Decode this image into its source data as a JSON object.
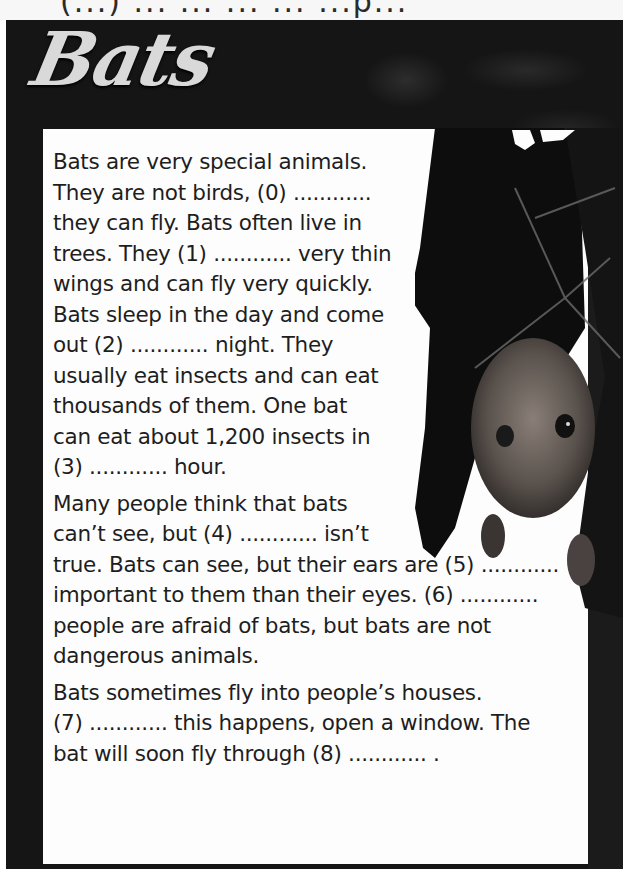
{
  "header_fragment": "(...) ... ... ... ... ...p...",
  "title": "Bats",
  "paragraphs": [
    {
      "lines": [
        "Bats are very special animals.",
        "They are not birds, (0) ............",
        "they can fly. Bats often live in",
        "trees. They (1) ............ very thin",
        "wings and can fly very quickly.",
        "Bats sleep in the day and come",
        "out (2) ............ night. They",
        "usually eat insects and can eat",
        "thousands of them. One bat",
        "can eat about 1,200 insects in",
        "(3) ............ hour."
      ]
    },
    {
      "lines": [
        "Many people think that bats",
        "can’t see, but (4) ............ isn’t",
        "true. Bats can see, but their ears are (5) ............",
        "important to them than their eyes. (6) ............",
        "people are afraid of bats, but bats are not",
        "dangerous animals."
      ]
    },
    {
      "lines": [
        "Bats sometimes fly into people’s houses.",
        "(7) ............ this happens, open a window. The",
        "bat will soon fly through (8) ............ ."
      ]
    }
  ],
  "gaps": [
    "(0)",
    "(1)",
    "(2)",
    "(3)",
    "(4)",
    "(5)",
    "(6)",
    "(7)",
    "(8)"
  ],
  "image": {
    "subject": "fruit bat hanging upside down",
    "icon": "bat-photo-icon"
  },
  "colors": {
    "panel": "#151515",
    "textbox": "#fdfdfd",
    "text": "#1e1e1e",
    "title": "#d9d9d9"
  }
}
